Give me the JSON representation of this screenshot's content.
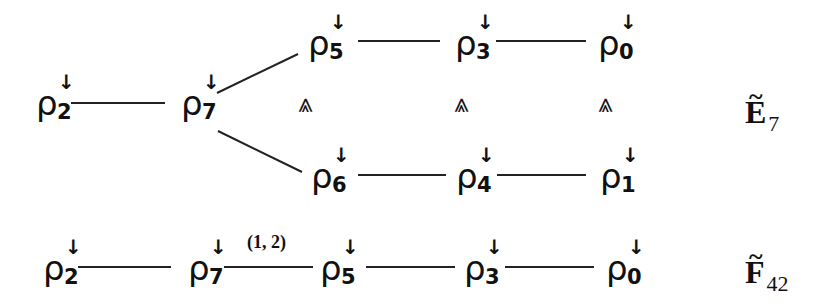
{
  "diagram_e7": {
    "label": {
      "letter": "E",
      "sub": "7",
      "tilde": "~"
    },
    "nodes": {
      "rho2": {
        "symbol": "ρ",
        "sup": "↓",
        "sub": "2"
      },
      "rho7": {
        "symbol": "ρ",
        "sup": "↓",
        "sub": "7"
      },
      "rho5": {
        "symbol": "ρ",
        "sup": "↓",
        "sub": "5"
      },
      "rho3": {
        "symbol": "ρ",
        "sup": "↓",
        "sub": "3"
      },
      "rho0": {
        "symbol": "ρ",
        "sup": "↓",
        "sub": "0"
      },
      "rho6": {
        "symbol": "ρ",
        "sup": "↓",
        "sub": "6"
      },
      "rho4": {
        "symbol": "ρ",
        "sup": "↓",
        "sub": "4"
      },
      "rho1": {
        "symbol": "ρ",
        "sup": "↓",
        "sub": "1"
      }
    },
    "equiv_symbol": "⪡"
  },
  "diagram_f42": {
    "label": {
      "letter": "F",
      "sub": "42",
      "tilde": "~"
    },
    "nodes": {
      "rho2": {
        "symbol": "ρ",
        "sup": "↓",
        "sub": "2"
      },
      "rho7": {
        "symbol": "ρ",
        "sup": "↓",
        "sub": "7"
      },
      "rho5": {
        "symbol": "ρ",
        "sup": "↓",
        "sub": "5"
      },
      "rho3": {
        "symbol": "ρ",
        "sup": "↓",
        "sub": "3"
      },
      "rho0": {
        "symbol": "ρ",
        "sup": "↓",
        "sub": "0"
      }
    },
    "edge_label": "(1, 2)"
  }
}
